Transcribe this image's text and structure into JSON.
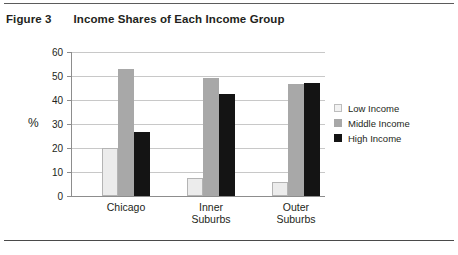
{
  "figure": {
    "label": "Figure 3",
    "title": "Income Shares of Each Income Group"
  },
  "chart_data": {
    "type": "bar",
    "title": "Income Shares of Each Income Group",
    "xlabel": "",
    "ylabel": "%",
    "ylim": [
      0,
      60
    ],
    "yticks": [
      0,
      10,
      20,
      30,
      40,
      50,
      60
    ],
    "ytick_labels": [
      "0",
      "10",
      "20",
      "30",
      "40",
      "50",
      "60"
    ],
    "grid": true,
    "legend_position": "right",
    "categories": [
      "Chicago",
      "Inner Suburbs",
      "Outer Suburbs"
    ],
    "category_lines": [
      [
        "Chicago"
      ],
      [
        "Inner",
        "Suburbs"
      ],
      [
        "Outer",
        "Suburbs"
      ]
    ],
    "series": [
      {
        "name": "Low Income",
        "color": "#f2f2f2",
        "values": [
          20,
          7.5,
          6
        ]
      },
      {
        "name": "Middle Income",
        "color": "#a8a8a8",
        "values": [
          53,
          49,
          46.5
        ]
      },
      {
        "name": "High Income",
        "color": "#141414",
        "values": [
          26.8,
          42.5,
          47
        ]
      }
    ]
  }
}
